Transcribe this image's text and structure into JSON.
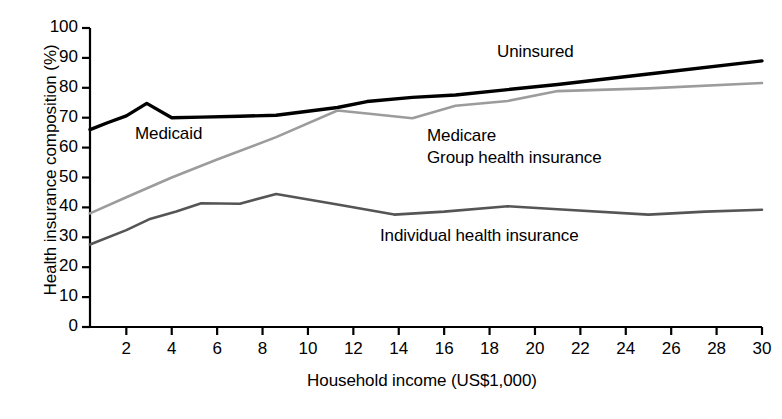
{
  "chart_data": {
    "type": "line",
    "title": "",
    "xlabel": "Household income (US$1,000)",
    "ylabel": "Health insurance composition (%)",
    "xlim": [
      0.4,
      30
    ],
    "ylim": [
      0,
      100
    ],
    "xticks": [
      2,
      4,
      6,
      8,
      10,
      12,
      14,
      16,
      18,
      20,
      22,
      24,
      26,
      28,
      30
    ],
    "yticks": [
      0,
      10,
      20,
      30,
      40,
      50,
      60,
      70,
      80,
      90,
      100
    ],
    "grid": false,
    "legend_position": "inline-annotations",
    "series": [
      {
        "name": "Uninsured",
        "color": "#000000",
        "width": 3.4,
        "points": [
          [
            0.4,
            66.0
          ],
          [
            1.2,
            68.4
          ],
          [
            2.0,
            70.6
          ],
          [
            2.9,
            74.8
          ],
          [
            4.0,
            70.0
          ],
          [
            5.3,
            70.2
          ],
          [
            7.0,
            70.5
          ],
          [
            8.6,
            70.8
          ],
          [
            11.3,
            73.4
          ],
          [
            12.6,
            75.4
          ],
          [
            14.6,
            76.8
          ],
          [
            16.5,
            77.6
          ],
          [
            18.8,
            79.4
          ],
          [
            21.0,
            81.1
          ],
          [
            25.0,
            84.6
          ],
          [
            30.0,
            89.0
          ]
        ]
      },
      {
        "name": "Medicaid",
        "color": "#000000",
        "width": 3.4,
        "note": "Medicaid label annotates the topmost black band region"
      },
      {
        "name": "Group health insurance",
        "color": "#9c9c9c",
        "width": 2.6,
        "points": [
          [
            0.4,
            38.0
          ],
          [
            2.0,
            43.4
          ],
          [
            4.0,
            50.0
          ],
          [
            6.0,
            56.0
          ],
          [
            8.6,
            63.5
          ],
          [
            11.3,
            72.4
          ],
          [
            12.6,
            71.4
          ],
          [
            14.6,
            69.8
          ],
          [
            16.5,
            74.0
          ],
          [
            18.8,
            75.6
          ],
          [
            21.0,
            78.9
          ],
          [
            25.0,
            79.8
          ],
          [
            30.0,
            81.6
          ]
        ]
      },
      {
        "name": "Medicare",
        "color": "#9c9c9c",
        "width": 2.6,
        "note": "Medicare label annotates the light-gray band region"
      },
      {
        "name": "Individual health insurance",
        "color": "#555555",
        "width": 2.6,
        "points": [
          [
            0.4,
            27.6
          ],
          [
            2.0,
            32.4
          ],
          [
            3.0,
            36.0
          ],
          [
            4.2,
            38.6
          ],
          [
            5.3,
            41.4
          ],
          [
            7.0,
            41.2
          ],
          [
            8.6,
            44.5
          ],
          [
            11.3,
            41.0
          ],
          [
            13.8,
            37.6
          ],
          [
            16.0,
            38.6
          ],
          [
            18.8,
            40.4
          ],
          [
            21.0,
            39.4
          ],
          [
            25.0,
            37.6
          ],
          [
            27.5,
            38.6
          ],
          [
            30.0,
            39.2
          ]
        ]
      }
    ],
    "annotations": [
      {
        "text": "Medicaid",
        "x_px": 135,
        "y_px": 124,
        "series": "Medicaid"
      },
      {
        "text": "Uninsured",
        "x_px": 497,
        "y_px": 42,
        "series": "Uninsured"
      },
      {
        "text": "Medicare",
        "x_px": 427,
        "y_px": 126,
        "series": "Medicare"
      },
      {
        "text": "Group health insurance",
        "x_px": 427,
        "y_px": 148,
        "series": "Group health insurance"
      },
      {
        "text": "Individual health insurance",
        "x_px": 380,
        "y_px": 226,
        "series": "Individual health insurance"
      }
    ],
    "y_tick_labels": [
      "100",
      "90",
      "80",
      "70",
      "60",
      "50",
      "40",
      "30",
      "20",
      "10",
      "0"
    ],
    "x_tick_labels": [
      "2",
      "4",
      "6",
      "8",
      "10",
      "12",
      "14",
      "16",
      "18",
      "20",
      "22",
      "24",
      "26",
      "28",
      "30"
    ]
  },
  "axes": {
    "x_title": "Household income (US$1,000)",
    "y_title": "Health insurance composition (%)"
  },
  "labels": {
    "medicaid": "Medicaid",
    "uninsured": "Uninsured",
    "medicare": "Medicare",
    "group_health_insurance": "Group health insurance",
    "individual_health_insurance": "Individual health insurance"
  },
  "colors": {
    "uninsured": "#000000",
    "group_health": "#9c9c9c",
    "individual_health": "#555555",
    "axis": "#000000",
    "background": "#ffffff"
  }
}
